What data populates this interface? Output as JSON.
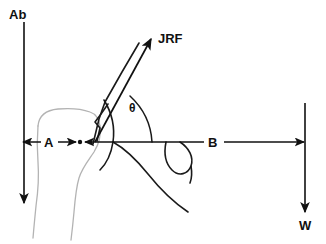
{
  "figure": {
    "background_color": "#ffffff",
    "width": 326,
    "height": 244
  },
  "colors": {
    "vector_stroke": "#111111",
    "bone_outline": "#b3b3b3",
    "scapula_outline": "#1a1a1a",
    "label_text": "#111111"
  },
  "labels": {
    "abduction_force": "Ab",
    "joint_reaction_force": "JRF",
    "angle": "θ",
    "moment_arm_a": "A",
    "moment_arm_b": "B",
    "weight": "W"
  },
  "vectors": [
    {
      "name": "abduction-force",
      "label": "Ab",
      "direction": "down",
      "from": [
        24,
        22
      ],
      "to": [
        24,
        203
      ]
    },
    {
      "name": "joint-reaction-force",
      "label": "JRF",
      "direction": "up-right",
      "from": [
        95,
        142
      ],
      "to": [
        152,
        38
      ]
    },
    {
      "name": "weight",
      "label": "W",
      "direction": "down",
      "from": [
        305,
        103
      ],
      "to": [
        305,
        212
      ]
    }
  ],
  "dimensions": [
    {
      "name": "moment-arm-a",
      "label": "A",
      "type": "double-arrow",
      "from": [
        22,
        142
      ],
      "to": [
        86,
        142
      ]
    },
    {
      "name": "moment-arm-b",
      "label": "B",
      "type": "arrow",
      "from": [
        110,
        142
      ],
      "to": [
        305,
        142
      ]
    }
  ],
  "markers": [
    {
      "name": "fulcrum-point",
      "label": "",
      "position": [
        79,
        142
      ]
    }
  ],
  "anatomy": [
    {
      "name": "humerus-outline",
      "style": "light-gray"
    },
    {
      "name": "scapula-glenoid-outline",
      "style": "dark"
    },
    {
      "name": "coracoid-outline",
      "style": "dark"
    },
    {
      "name": "deltoid-muscle-lines",
      "style": "dark"
    }
  ]
}
